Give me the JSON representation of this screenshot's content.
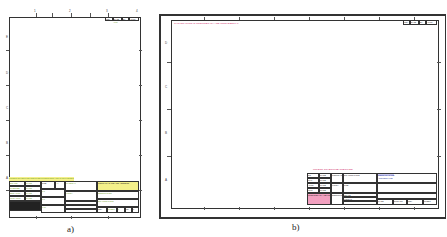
{
  "panels": [
    {
      "id": "a",
      "caption": "a)",
      "orientation": "portrait",
      "zones_top": [
        "1",
        "2",
        "3",
        "4"
      ],
      "zones_side": [
        "E",
        "D",
        "C",
        "B",
        "A"
      ],
      "revision_block": {
        "cols": [
          "REV",
          "DATE",
          "BY",
          "APPR"
        ],
        "green_value": "A001"
      },
      "title_block": {
        "notes_banner": "UNLESS OTHERWISE SPECIFIED DIMENSIONS ARE IN MILLIMETERS",
        "left_rows": [
          [
            "DRAWN",
            "NAME"
          ],
          [
            "CHECKED",
            "NAME"
          ],
          [
            "ENG APPR",
            "NAME"
          ],
          [
            "MFG APPR",
            "NAME"
          ]
        ],
        "mid_labels": [
          "SIZE",
          "SCALE",
          "SHEET",
          "WEIGHT"
        ],
        "mid_values": [
          "A4",
          "1:1",
          "1/1",
          "0.00"
        ],
        "green_fields": [
          "MATERIAL",
          "FINISH",
          "PART NUMBER",
          "DESCRIPTION",
          "DRAWING TITLE"
        ],
        "company_header": "COMPANY NAME AND ADDRESS",
        "drawing_number": "DWG NO",
        "bottom_cells": [
          "REV",
          "SHEET",
          "1",
          "OF",
          "1"
        ]
      }
    },
    {
      "id": "b",
      "caption": "b)",
      "orientation": "landscape",
      "zones_top": [
        "8",
        "7",
        "6",
        "5",
        "4",
        "3",
        "2",
        "1"
      ],
      "zones_side": [
        "D",
        "C",
        "B",
        "A"
      ],
      "top_note": "THIS DRAWING IS PROPRIETARY AND CONFIDENTIAL",
      "revision_block": {
        "cols": [
          "REV",
          "DATE",
          "BY",
          "APPR"
        ]
      },
      "title_block": {
        "pink_header": "UNLESS OTHERWISE SPECIFIED",
        "left_rows": [
          [
            "DR",
            "NAME"
          ],
          [
            "CHK",
            "NAME"
          ],
          [
            "APPR",
            "NAME"
          ],
          [
            "MFG",
            "NAME"
          ]
        ],
        "pink_note": "PROPRIETARY AND CONFIDENTIAL NOTICE",
        "mid_labels": [
          "CONTRACT",
          "FINISH",
          "DESCRIPTION"
        ],
        "right_labels": [
          "DRAWING TITLE",
          "SIZE",
          "SCALE",
          "WEIGHT"
        ],
        "company_header": "COMPANY NAME",
        "company_sub": "ADDRESS LINE",
        "bottom_cells": [
          "CAGE",
          "DWG NO",
          "REV",
          "SHEET"
        ]
      }
    }
  ]
}
